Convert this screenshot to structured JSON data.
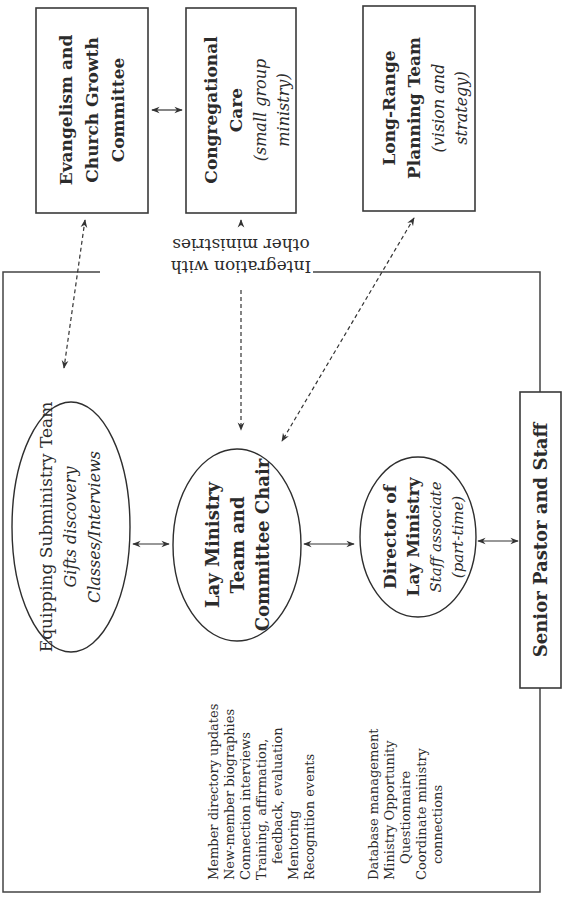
{
  "diagram": {
    "orientation": "rotated 90 degrees counter-clockwise",
    "top_boxes": {
      "evangelism": {
        "lines": [
          "Evangelism and",
          "Church Growth",
          "Committee"
        ]
      },
      "congregational_care": {
        "lines": [
          "Congregational",
          "Care"
        ],
        "subtitle_lines": [
          "(small group",
          "ministry)"
        ]
      },
      "long_range": {
        "lines": [
          "Long-Range",
          "Planning Team"
        ],
        "subtitle_lines": [
          "(vision and",
          "strategy)"
        ]
      }
    },
    "integration_label": {
      "lines": [
        "Integration with",
        "other ministries"
      ]
    },
    "ellipses": {
      "equipping": {
        "title": "Equipping Subministry Team",
        "subtitle_lines": [
          "Gifts discovery",
          "Classes/Interviews"
        ]
      },
      "lay_ministry": {
        "lines": [
          "Lay Ministry",
          "Team and",
          "Committee Chair"
        ]
      },
      "director": {
        "lines": [
          "Director of",
          "Lay Ministry"
        ],
        "subtitle_lines": [
          "Staff associate",
          "(part-time)"
        ]
      }
    },
    "senior_pastor": {
      "label": "Senior Pastor and Staff"
    },
    "lay_ministry_tasks": [
      "Member directory updates",
      "New-member biographies",
      "Connection interviews",
      "Training, affirmation,",
      "feedback, evaluation",
      "Mentoring",
      "Recognition events"
    ],
    "director_tasks": [
      "Database management",
      "Ministry Opportunity",
      "Questionnaire",
      "Coordinate ministry",
      "connections"
    ]
  }
}
